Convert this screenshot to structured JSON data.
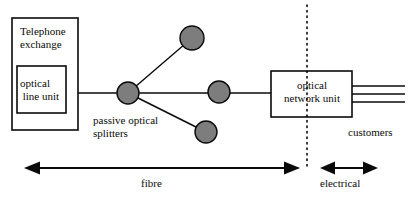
{
  "diagram": {
    "type": "network-topology",
    "colors": {
      "stroke": "#0a0a0a",
      "node_fill": "#7d7d7d",
      "background": "#ffffff"
    },
    "boxes": {
      "telephone_exchange": {
        "label": "Telephone\nexchange",
        "x": 12,
        "y": 18,
        "w": 66,
        "h": 112
      },
      "optical_line_unit": {
        "label": "optical\n line unit",
        "x": 17,
        "y": 66,
        "w": 49,
        "h": 47
      },
      "optical_network_unit": {
        "label": "optical\nnetwork unit",
        "x": 271,
        "y": 71,
        "w": 81,
        "h": 46
      }
    },
    "nodes": {
      "splitter_main": {
        "cx": 128,
        "cy": 93,
        "r": 11
      },
      "splitter_top": {
        "cx": 192,
        "cy": 38,
        "r": 12
      },
      "splitter_middle": {
        "cx": 219,
        "cy": 92,
        "r": 11
      },
      "splitter_bottom": {
        "cx": 206,
        "cy": 132,
        "r": 11
      }
    },
    "labels": {
      "passive_optical_splitters": "passive optical\nsplitters",
      "customers": "customers"
    },
    "customer_lines": {
      "count": 3,
      "y_positions": [
        86,
        94,
        102
      ],
      "x_start": 352,
      "x_end": 405
    },
    "boundary": {
      "name": "optical-electrical-boundary",
      "style": "dotted-vertical",
      "x": 307,
      "y_top": 5,
      "y_bottom": 170
    },
    "spans": [
      {
        "name": "fibre",
        "label": "fibre",
        "arrow": "double",
        "x_start": 27,
        "x_end": 297,
        "y": 168
      },
      {
        "name": "electrical",
        "label": "electrical",
        "arrow": "double",
        "x_start": 322,
        "x_end": 376,
        "y": 168
      }
    ]
  }
}
